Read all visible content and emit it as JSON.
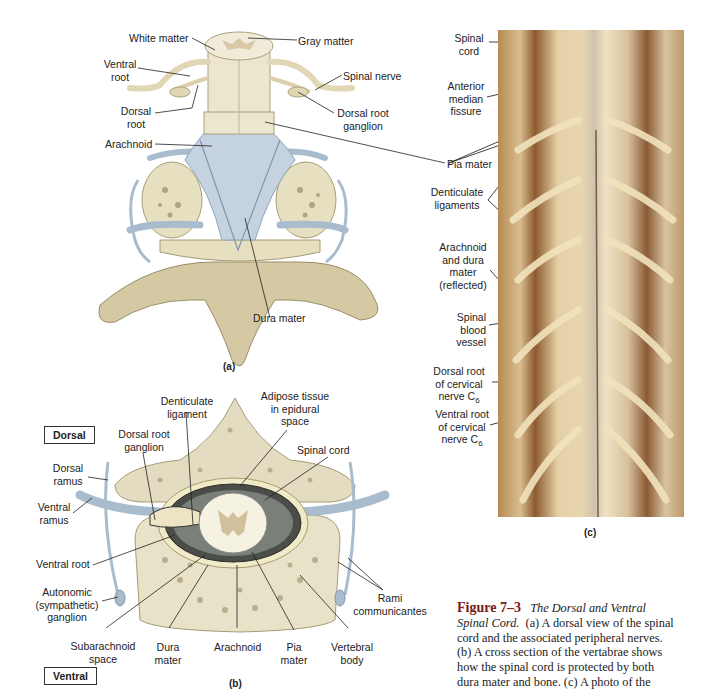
{
  "figure": {
    "number": "Figure 7–3",
    "title": "The Dorsal and Ventral Spinal Cord.",
    "caption_lines": [
      "(a) A dorsal view of the spinal",
      "cord and the associated peripheral nerves.",
      "(b) A cross section of the vertabrae shows",
      "how the spinal cord is protected by both",
      "dura mater and bone. (c) A photo of the"
    ],
    "caption_title_line1": "The Dorsal and Ventral",
    "caption_title_line2": "Spinal Cord."
  },
  "panel_a": {
    "tag": "(a)",
    "labels": {
      "white_matter": "White matter",
      "gray_matter": "Gray matter",
      "ventral_root": [
        "Ventral",
        "root"
      ],
      "spinal_nerve": "Spinal nerve",
      "dorsal_root": [
        "Dorsal",
        "root"
      ],
      "dorsal_root_ganglion": [
        "Dorsal root",
        "ganglion"
      ],
      "arachnoid": "Arachnoid",
      "pia_mater": "Pia mater",
      "dura_mater": "Dura mater"
    }
  },
  "panel_b": {
    "tag": "(b)",
    "orientation_top": "Dorsal",
    "orientation_bottom": "Ventral",
    "labels": {
      "denticulate_ligament": [
        "Denticulate",
        "ligament"
      ],
      "adipose_tissue": [
        "Adipose tissue",
        "in epidural",
        "space"
      ],
      "dorsal_root_ganglion": [
        "Dorsal root",
        "ganglion"
      ],
      "spinal_cord": "Spinal cord",
      "dorsal_ramus": [
        "Dorsal",
        "ramus"
      ],
      "ventral_ramus": [
        "Ventral",
        "ramus"
      ],
      "ventral_root": "Ventral root",
      "autonomic_ganglion": [
        "Autonomic",
        "(sympathetic)",
        "ganglion"
      ],
      "rami_communicantes": [
        "Rami",
        "communicantes"
      ],
      "subarachnoid_space": [
        "Subarachnoid",
        "space"
      ],
      "dura_mater": [
        "Dura",
        "mater"
      ],
      "arachnoid": "Arachnoid",
      "pia_mater": [
        "Pia",
        "mater"
      ],
      "vertebral_body": [
        "Vertebral",
        "body"
      ]
    }
  },
  "panel_c": {
    "tag": "(c)",
    "labels": {
      "spinal_cord": [
        "Spinal",
        "cord"
      ],
      "anterior_median_fissure": [
        "Anterior",
        "median",
        "fissure"
      ],
      "denticulate_ligaments": [
        "Denticulate",
        "ligaments"
      ],
      "arachnoid_dura": [
        "Arachnoid",
        "and dura",
        "mater",
        "(reflected)"
      ],
      "spinal_blood_vessel": [
        "Spinal",
        "blood",
        "vessel"
      ],
      "dorsal_root_c6": [
        "Dorsal root",
        "of cervical",
        "nerve C"
      ],
      "ventral_root_c6": [
        "Ventral root",
        "of cervical",
        "nerve C"
      ],
      "subscript": "6"
    }
  }
}
